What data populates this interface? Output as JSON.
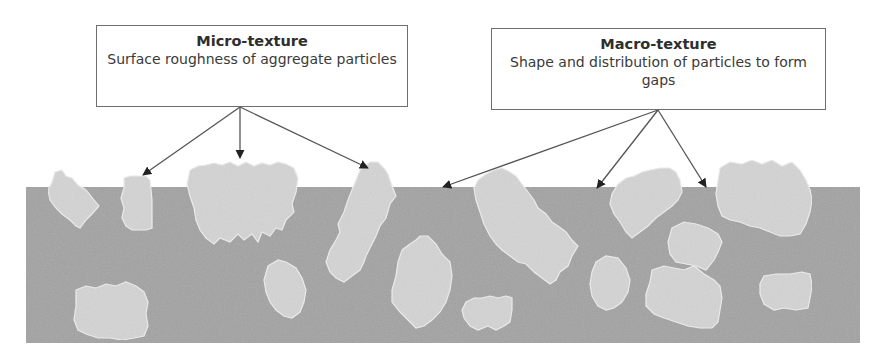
{
  "diagram": {
    "labels": [
      {
        "id": "micro",
        "title": "Micro-texture",
        "description": "Surface roughness of aggregate particles"
      },
      {
        "id": "macro",
        "title": "Macro-texture",
        "description": "Shape and distribution of particles to form gaps"
      }
    ],
    "colors": {
      "matrix": "#a3a3a3",
      "particle": "#d6d6d6",
      "particle_edge": "#ececec",
      "arrow": "#555555",
      "arrowhead": "#222222",
      "box_border": "#6e6e6e",
      "text": "#333333"
    },
    "arrow_targets": {
      "micro": [
        "particle-top-left",
        "particle-top-large",
        "particle-top-tilted"
      ],
      "macro": [
        "gap-left",
        "gap-middle",
        "gap-right"
      ]
    }
  }
}
